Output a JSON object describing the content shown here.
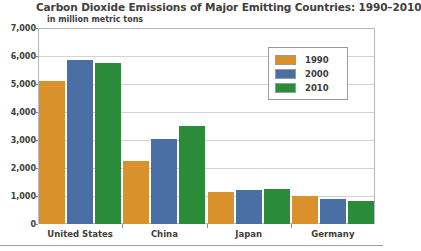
{
  "chart_data": {
    "type": "bar",
    "title": "Carbon Dioxide Emissions of Major Emitting Countries: 1990–2010",
    "subtitle": "in million metric tons",
    "xlabel": "",
    "ylabel": "",
    "ylim": [
      0,
      7000
    ],
    "ytick_labels": [
      "7,000",
      "6,000",
      "5,000",
      "4,000",
      "3,000",
      "2,000",
      "1,000",
      "0"
    ],
    "ytick_values": [
      7000,
      6000,
      5000,
      4000,
      3000,
      2000,
      1000,
      0
    ],
    "grid": true,
    "legend_position": "top-right",
    "categories": [
      "United States",
      "China",
      "Japan",
      "Germany"
    ],
    "series": [
      {
        "name": "1990",
        "color": "#d9922b",
        "values": [
          5120,
          2250,
          1150,
          1000
        ]
      },
      {
        "name": "2000",
        "color": "#4a6fa5",
        "values": [
          5860,
          3030,
          1200,
          880
        ]
      },
      {
        "name": "2010",
        "color": "#2a8b38",
        "values": [
          5750,
          3500,
          1250,
          830
        ]
      }
    ]
  }
}
